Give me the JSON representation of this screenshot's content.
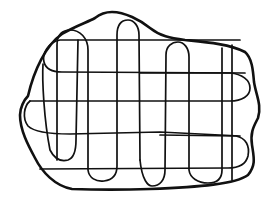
{
  "drawing": {
    "subject": "hand-drawn blob outline with serpentine grid",
    "stroke_color": "#111111",
    "background_color": "#ffffff",
    "outline_width": 2.6,
    "grid_width": 1.7
  }
}
